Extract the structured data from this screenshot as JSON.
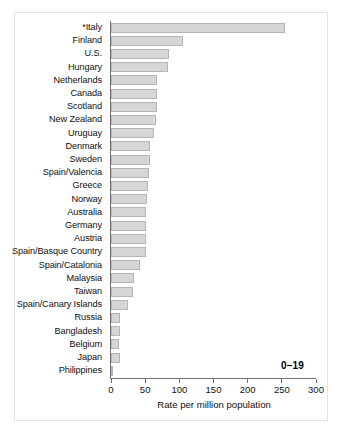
{
  "chart_data": {
    "type": "bar",
    "orientation": "horizontal",
    "title": "",
    "xlabel": "Rate per million population",
    "ylabel": "",
    "xlim": [
      0,
      300
    ],
    "xticks": [
      0,
      50,
      100,
      150,
      200,
      250,
      300
    ],
    "grid": false,
    "legend": null,
    "annotations": [
      {
        "text": "0–19",
        "note": "age-group annotation, bold, lower right of plot"
      }
    ],
    "footnote_marker": "*",
    "categories": [
      "*Italy",
      "Finland",
      "U.S.",
      "Hungary",
      "Netherlands",
      "Canada",
      "Scotland",
      "New Zealand",
      "Uruguay",
      "Denmark",
      "Sweden",
      "Spain/Valencia",
      "Greece",
      "Norway",
      "Australia",
      "Germany",
      "Austria",
      "Spain/Basque Country",
      "Spain/Catalonia",
      "Malaysia",
      "Taiwan",
      "Spain/Canary Islands",
      "Russia",
      "Bangladesh",
      "Belgium",
      "Japan",
      "Philippines"
    ],
    "values": [
      254,
      105,
      85,
      84,
      68,
      68,
      67,
      66,
      63,
      57,
      57,
      55,
      54,
      53,
      51,
      51,
      51,
      51,
      43,
      34,
      32,
      25,
      13,
      13,
      12,
      13,
      1
    ],
    "bar_color": "#d6d6d6",
    "bar_edge_color": "#b5b5b5",
    "axis_color": "#6f6f6f"
  },
  "axis": {
    "x_title": "Rate per million population",
    "tick_labels": [
      "0",
      "50",
      "100",
      "150",
      "200",
      "250",
      "300"
    ]
  },
  "annotation": {
    "age_range": "0–19"
  }
}
